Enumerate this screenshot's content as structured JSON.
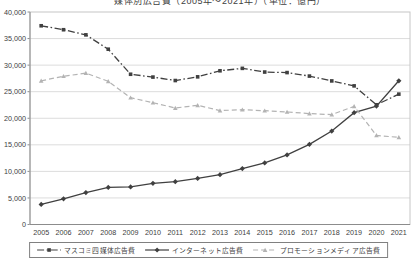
{
  "chart_data": {
    "type": "line",
    "title": "媒体別広告費（2005年～2021年）（単位：億円）",
    "categories": [
      "2005",
      "2006",
      "2007",
      "2008",
      "2009",
      "2010",
      "2011",
      "2012",
      "2013",
      "2014",
      "2015",
      "2016",
      "2017",
      "2018",
      "2019",
      "2020",
      "2021"
    ],
    "series": [
      {
        "name": "マスコミ四媒体広告費",
        "marker": "square",
        "line_style": "dashdot",
        "color": "#404040",
        "values": [
          37408,
          36662,
          35699,
          32995,
          28282,
          27749,
          27100,
          27796,
          28935,
          29393,
          28699,
          28596,
          27938,
          27026,
          26094,
          22536,
          24538
        ]
      },
      {
        "name": "インターネット広告費",
        "marker": "diamond",
        "line_style": "solid",
        "color": "#404040",
        "values": [
          3777,
          4826,
          6003,
          6983,
          7069,
          7747,
          8062,
          8680,
          9381,
          10519,
          11594,
          13100,
          15094,
          17589,
          21048,
          22290,
          27052
        ]
      },
      {
        "name": "プロモーションメディア広告費",
        "marker": "triangle",
        "line_style": "dashed",
        "color": "#b3b3b3",
        "values": [
          27050,
          27911,
          28489,
          26948,
          23871,
          22931,
          21934,
          22437,
          21446,
          21610,
          21417,
          21184,
          20875,
          20685,
          22239,
          16768,
          16408
        ]
      }
    ],
    "ylim": [
      0,
      40000
    ],
    "ytick_interval": 5000,
    "yticks": [
      "0",
      "5,000",
      "10,000",
      "15,000",
      "20,000",
      "25,000",
      "30,000",
      "35,000",
      "40,000"
    ],
    "grid": "horizontal",
    "legend_position": "bottom",
    "axis_colors": {
      "gridline": "#dcdcdc",
      "frame": "#c6c6c6",
      "axis_line": "#8c8c8c",
      "tick_label": "#404040"
    }
  }
}
